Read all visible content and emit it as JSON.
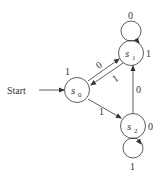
{
  "diagram": {
    "type": "finite-state-machine",
    "start_label": "Start",
    "states": [
      {
        "id": "s0",
        "name": "s",
        "sub": "0",
        "output": "1"
      },
      {
        "id": "s1",
        "name": "s",
        "sub": "1",
        "output": "1"
      },
      {
        "id": "s2",
        "name": "s",
        "sub": "2",
        "output": "0"
      }
    ],
    "transitions": [
      {
        "from": "s0",
        "to": "s1",
        "input": "0"
      },
      {
        "from": "s1",
        "to": "s0",
        "input": "1"
      },
      {
        "from": "s0",
        "to": "s2",
        "input": "1"
      },
      {
        "from": "s2",
        "to": "s1",
        "input": "0"
      },
      {
        "from": "s1",
        "to": "s1",
        "input": "0"
      },
      {
        "from": "s2",
        "to": "s2",
        "input": "1"
      }
    ],
    "colors": {
      "stroke": "#333333",
      "background": "#ffffff"
    }
  }
}
